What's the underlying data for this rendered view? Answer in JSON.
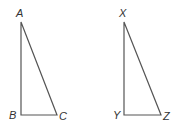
{
  "diagram": {
    "type": "geometry",
    "colors": {
      "line": "#555555",
      "label": "#333333",
      "background": "#ffffff"
    },
    "triangles": [
      {
        "name": "ABC",
        "vertices": {
          "A": {
            "label": "A",
            "x": 21,
            "y": 22
          },
          "B": {
            "label": "B",
            "x": 21,
            "y": 115
          },
          "C": {
            "label": "C",
            "x": 57,
            "y": 115
          }
        },
        "right_angle_at": "B"
      },
      {
        "name": "XYZ",
        "vertices": {
          "X": {
            "label": "X",
            "x": 124,
            "y": 22
          },
          "Y": {
            "label": "Y",
            "x": 124,
            "y": 115
          },
          "Z": {
            "label": "Z",
            "x": 161,
            "y": 115
          }
        },
        "right_angle_at": "Y"
      }
    ]
  }
}
